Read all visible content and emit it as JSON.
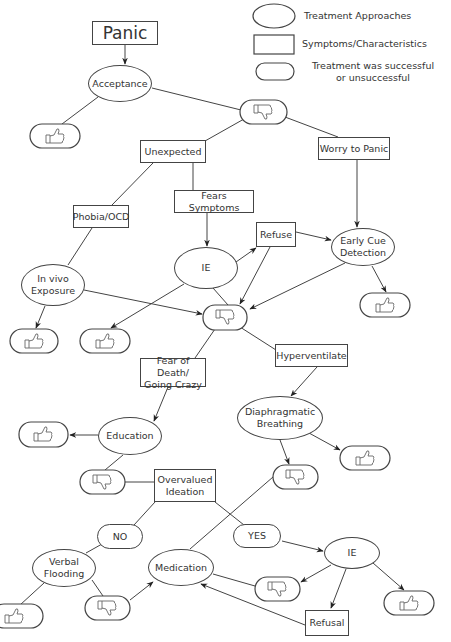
{
  "diagram": {
    "title": "Panic",
    "legend": [
      {
        "shape": "ellipse",
        "label": "Treatment Approaches"
      },
      {
        "shape": "rectangle",
        "label": "Symptoms/Characteristics"
      },
      {
        "shape": "rounded-pill",
        "label": "Treatment was successful\nor unsuccessful"
      }
    ],
    "nodes": {
      "panic": {
        "shape": "rectangle",
        "label": "Panic"
      },
      "acceptance": {
        "shape": "ellipse",
        "label": "Acceptance"
      },
      "unexpected": {
        "shape": "rectangle",
        "label": "Unexpected"
      },
      "worry_to_panic": {
        "shape": "rectangle",
        "label": "Worry to Panic"
      },
      "phobia_ocd": {
        "shape": "rectangle",
        "label": "Phobia/OCD"
      },
      "fears_symptoms": {
        "shape": "rectangle",
        "label": "Fears Symptoms"
      },
      "refuse": {
        "shape": "rectangle",
        "label": "Refuse"
      },
      "ie_top": {
        "shape": "ellipse",
        "label": "IE"
      },
      "early_cue": {
        "shape": "ellipse",
        "label": "Early Cue\nDetection"
      },
      "in_vivo": {
        "shape": "ellipse",
        "label": "In vivo\nExposure"
      },
      "fear_death": {
        "shape": "rectangle",
        "label": "Fear of Death/\nGoing Crazy"
      },
      "hyperventilate": {
        "shape": "rectangle",
        "label": "Hyperventilate"
      },
      "diaphragmatic": {
        "shape": "ellipse",
        "label": "Diaphragmatic\nBreathing"
      },
      "education": {
        "shape": "ellipse",
        "label": "Education"
      },
      "overvalued": {
        "shape": "rectangle",
        "label": "Overvalued\nIdeation"
      },
      "no": {
        "shape": "rounded-pill",
        "label": "NO"
      },
      "yes": {
        "shape": "rounded-pill",
        "label": "YES"
      },
      "ie_bottom": {
        "shape": "ellipse",
        "label": "IE"
      },
      "verbal_flooding": {
        "shape": "ellipse",
        "label": "Verbal\nFlooding"
      },
      "medication": {
        "shape": "ellipse",
        "label": "Medication"
      },
      "refusal": {
        "shape": "rectangle",
        "label": "Refusal"
      }
    },
    "outcomes": [
      {
        "id": "acc_up",
        "result": "thumbs-up"
      },
      {
        "id": "acc_down",
        "result": "thumbs-down"
      },
      {
        "id": "mid_down",
        "result": "thumbs-down"
      },
      {
        "id": "invivo_up",
        "result": "thumbs-up"
      },
      {
        "id": "ie_up",
        "result": "thumbs-up"
      },
      {
        "id": "ecd_up",
        "result": "thumbs-up"
      },
      {
        "id": "edu_up",
        "result": "thumbs-up"
      },
      {
        "id": "edu_down",
        "result": "thumbs-down"
      },
      {
        "id": "dia_down",
        "result": "thumbs-down"
      },
      {
        "id": "dia_up",
        "result": "thumbs-up"
      },
      {
        "id": "vf_up",
        "result": "thumbs-up"
      },
      {
        "id": "vf_down",
        "result": "thumbs-down"
      },
      {
        "id": "ie2_down",
        "result": "thumbs-down"
      },
      {
        "id": "ie2_up",
        "result": "thumbs-up"
      }
    ],
    "edges": [
      {
        "from": "panic",
        "to": "acceptance",
        "arrow": true
      },
      {
        "from": "acceptance",
        "to": "acc_up",
        "arrow": false
      },
      {
        "from": "acceptance",
        "to": "acc_down",
        "arrow": false
      },
      {
        "from": "acc_down",
        "to": "unexpected",
        "arrow": false
      },
      {
        "from": "acc_down",
        "to": "worry_to_panic",
        "arrow": false
      },
      {
        "from": "unexpected",
        "to": "phobia_ocd",
        "arrow": false
      },
      {
        "from": "unexpected",
        "to": "fears_symptoms",
        "arrow": false
      },
      {
        "from": "fears_symptoms",
        "to": "ie_top",
        "arrow": true
      },
      {
        "from": "worry_to_panic",
        "to": "early_cue",
        "arrow": true
      },
      {
        "from": "phobia_ocd",
        "to": "in_vivo",
        "arrow": false
      },
      {
        "from": "ie_top",
        "to": "refuse",
        "arrow": true
      },
      {
        "from": "refuse",
        "to": "early_cue",
        "arrow": true
      },
      {
        "from": "refuse",
        "to": "mid_down",
        "arrow": true
      },
      {
        "from": "early_cue",
        "to": "mid_down",
        "arrow": true
      },
      {
        "from": "early_cue",
        "to": "ecd_up",
        "arrow": true
      },
      {
        "from": "in_vivo",
        "to": "mid_down",
        "arrow": true
      },
      {
        "from": "in_vivo",
        "to": "invivo_up",
        "arrow": true
      },
      {
        "from": "ie_top",
        "to": "ie_up",
        "arrow": true
      },
      {
        "from": "ie_top",
        "to": "mid_down",
        "arrow": false
      },
      {
        "from": "mid_down",
        "to": "fear_death",
        "arrow": false
      },
      {
        "from": "mid_down",
        "to": "hyperventilate",
        "arrow": false
      },
      {
        "from": "fear_death",
        "to": "education",
        "arrow": true
      },
      {
        "from": "hyperventilate",
        "to": "diaphragmatic",
        "arrow": true
      },
      {
        "from": "education",
        "to": "edu_up",
        "arrow": true
      },
      {
        "from": "education",
        "to": "edu_down",
        "arrow": false
      },
      {
        "from": "edu_down",
        "to": "overvalued",
        "arrow": false
      },
      {
        "from": "diaphragmatic",
        "to": "dia_down",
        "arrow": true
      },
      {
        "from": "diaphragmatic",
        "to": "dia_up",
        "arrow": true
      },
      {
        "from": "dia_down",
        "to": "medication",
        "arrow": false
      },
      {
        "from": "overvalued",
        "to": "no",
        "arrow": false
      },
      {
        "from": "overvalued",
        "to": "yes",
        "arrow": false
      },
      {
        "from": "no",
        "to": "verbal_flooding",
        "arrow": false
      },
      {
        "from": "yes",
        "to": "ie_bottom",
        "arrow": true
      },
      {
        "from": "verbal_flooding",
        "to": "vf_up",
        "arrow": false
      },
      {
        "from": "verbal_flooding",
        "to": "vf_down",
        "arrow": false
      },
      {
        "from": "vf_down",
        "to": "medication",
        "arrow": true
      },
      {
        "from": "ie_bottom",
        "to": "ie2_down",
        "arrow": true
      },
      {
        "from": "ie_bottom",
        "to": "refusal",
        "arrow": true
      },
      {
        "from": "ie_bottom",
        "to": "ie2_up",
        "arrow": true
      },
      {
        "from": "ie2_down",
        "to": "medication",
        "arrow": false
      },
      {
        "from": "refusal",
        "to": "medication",
        "arrow": true
      }
    ],
    "colors": {
      "stroke": "#444444",
      "text": "#333333",
      "background": "#ffffff"
    }
  }
}
